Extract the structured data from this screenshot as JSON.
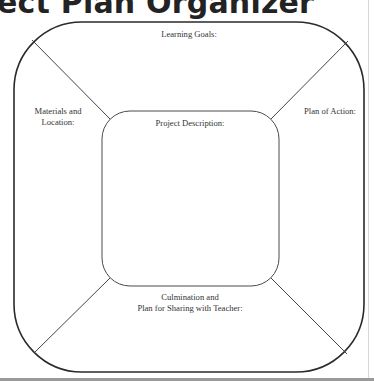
{
  "page": {
    "title": "ect Plan Organizer"
  },
  "organizer": {
    "sections": {
      "top": "Learning Goals:",
      "left_line1": "Materials and",
      "left_line2": "Location:",
      "right": "Plan of Action:",
      "center": "Project Description:",
      "bottom_line1": "Culmination and",
      "bottom_line2": "Plan for Sharing with Teacher:"
    }
  },
  "colors": {
    "line": "#2a2a2a",
    "text": "#333333",
    "background": "#ffffff",
    "footer_bar": "#9a9a9a"
  }
}
